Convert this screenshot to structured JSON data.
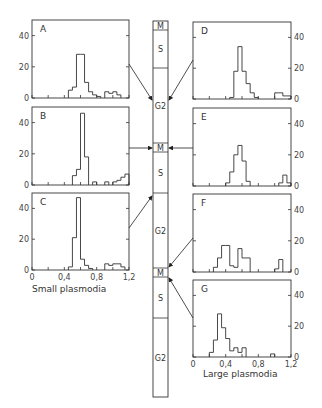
{
  "figure": {
    "left_caption": "Small plasmodia",
    "right_caption": "Large plasmodia"
  },
  "cell_cycle_column": {
    "segments": [
      {
        "label": "M",
        "y0": 21,
        "y1": 30
      },
      {
        "label": "S",
        "y0": 30,
        "y1": 68
      },
      {
        "label": "G2",
        "y0": 68,
        "y1": 143
      },
      {
        "label": "M",
        "y0": 143,
        "y1": 152
      },
      {
        "label": "S",
        "y0": 152,
        "y1": 193
      },
      {
        "label": "G2",
        "y0": 193,
        "y1": 268
      },
      {
        "label": "M",
        "y0": 268,
        "y1": 277
      },
      {
        "label": "S",
        "y0": 277,
        "y1": 318
      },
      {
        "label": "G2",
        "y0": 318,
        "y1": 397
      }
    ]
  },
  "chart_data": [
    {
      "type": "bar",
      "panel": "A",
      "group": "Small plasmodia",
      "side": "left",
      "box": [
        32,
        20,
        97,
        78
      ],
      "arrow_from": [
        129,
        64
      ],
      "arrow_to": [
        152,
        100
      ],
      "bin_width": 0.05,
      "xlim": [
        0,
        1.2
      ],
      "ylim": [
        0,
        50
      ],
      "xticks": [
        0,
        0.4,
        0.8,
        1.2
      ],
      "yticks": [
        0,
        20,
        40
      ],
      "bins": [
        [
          0.45,
          5
        ],
        [
          0.5,
          7
        ],
        [
          0.55,
          28
        ],
        [
          0.6,
          28
        ],
        [
          0.65,
          10
        ],
        [
          0.7,
          4
        ],
        [
          0.75,
          2
        ],
        [
          0.8,
          1
        ],
        [
          0.9,
          4
        ],
        [
          0.95,
          3
        ],
        [
          1.0,
          4
        ],
        [
          1.05,
          2
        ]
      ]
    },
    {
      "type": "bar",
      "panel": "B",
      "group": "Small plasmodia",
      "side": "left",
      "box": [
        32,
        107,
        97,
        78
      ],
      "arrow_from": [
        129,
        148
      ],
      "arrow_to": [
        152,
        148
      ],
      "bin_width": 0.05,
      "xlim": [
        0,
        1.2
      ],
      "ylim": [
        0,
        50
      ],
      "xticks": [
        0,
        0.4,
        0.8,
        1.2
      ],
      "yticks": [
        0,
        20,
        40
      ],
      "bins": [
        [
          0.5,
          6
        ],
        [
          0.55,
          10
        ],
        [
          0.6,
          46
        ],
        [
          0.65,
          18
        ],
        [
          0.75,
          2
        ],
        [
          0.9,
          2
        ],
        [
          1.0,
          2
        ],
        [
          1.05,
          3
        ],
        [
          1.1,
          5
        ],
        [
          1.15,
          7
        ]
      ]
    },
    {
      "type": "bar",
      "panel": "C",
      "group": "Small plasmodia",
      "side": "left",
      "box": [
        32,
        193,
        97,
        77
      ],
      "arrow_from": [
        129,
        228
      ],
      "arrow_to": [
        152,
        196
      ],
      "bin_width": 0.05,
      "xlim": [
        0,
        1.2
      ],
      "ylim": [
        0,
        50
      ],
      "xticks": [
        0,
        0.4,
        0.8,
        1.2
      ],
      "xticklabels": [
        "0",
        "0,4",
        "0,8",
        "1,2"
      ],
      "yticks": [
        0,
        20,
        40
      ],
      "bins": [
        [
          0.45,
          2
        ],
        [
          0.5,
          21
        ],
        [
          0.55,
          47
        ],
        [
          0.6,
          7
        ],
        [
          0.65,
          3
        ],
        [
          0.7,
          1
        ],
        [
          0.9,
          4
        ],
        [
          0.95,
          3
        ],
        [
          1.0,
          4
        ],
        [
          1.05,
          4
        ],
        [
          1.1,
          2
        ]
      ]
    },
    {
      "type": "bar",
      "panel": "D",
      "group": "Large plasmodia",
      "side": "right",
      "box": [
        193,
        22,
        98,
        77
      ],
      "arrow_from": [
        193,
        60
      ],
      "arrow_to": [
        169,
        100
      ],
      "bin_width": 0.05,
      "xlim": [
        0,
        1.2
      ],
      "ylim": [
        0,
        50
      ],
      "xticks": [
        0,
        0.4,
        0.8,
        1.2
      ],
      "yticks": [
        0,
        20,
        40
      ],
      "bins": [
        [
          0.45,
          1
        ],
        [
          0.5,
          18
        ],
        [
          0.55,
          34
        ],
        [
          0.6,
          18
        ],
        [
          0.65,
          10
        ],
        [
          0.7,
          4
        ],
        [
          0.75,
          1
        ],
        [
          1.0,
          4
        ],
        [
          1.05,
          4
        ],
        [
          1.1,
          2
        ],
        [
          1.15,
          2
        ]
      ]
    },
    {
      "type": "bar",
      "panel": "E",
      "group": "Large plasmodia",
      "side": "right",
      "box": [
        193,
        108,
        98,
        78
      ],
      "arrow_from": [
        193,
        148
      ],
      "arrow_to": [
        169,
        148
      ],
      "bin_width": 0.05,
      "xlim": [
        0,
        1.2
      ],
      "ylim": [
        0,
        50
      ],
      "xticks": [
        0,
        0.4,
        0.8,
        1.2
      ],
      "yticks": [
        0,
        20,
        40
      ],
      "bins": [
        [
          0.4,
          2
        ],
        [
          0.45,
          9
        ],
        [
          0.5,
          20
        ],
        [
          0.55,
          26
        ],
        [
          0.6,
          16
        ],
        [
          0.65,
          3
        ],
        [
          1.05,
          2
        ],
        [
          1.1,
          7
        ],
        [
          1.15,
          2
        ]
      ]
    },
    {
      "type": "bar",
      "panel": "F",
      "group": "Large plasmodia",
      "side": "right",
      "box": [
        193,
        194,
        98,
        78
      ],
      "arrow_from": [
        193,
        238
      ],
      "arrow_to": [
        169,
        267
      ],
      "bin_width": 0.05,
      "xlim": [
        0,
        1.2
      ],
      "ylim": [
        0,
        50
      ],
      "xticks": [
        0,
        0.4,
        0.8,
        1.2
      ],
      "yticks": [
        0,
        20,
        40
      ],
      "bins": [
        [
          0.25,
          3
        ],
        [
          0.3,
          9
        ],
        [
          0.35,
          17
        ],
        [
          0.4,
          17
        ],
        [
          0.45,
          4
        ],
        [
          0.5,
          3
        ],
        [
          0.55,
          15
        ],
        [
          0.6,
          9
        ],
        [
          0.65,
          9
        ],
        [
          1.0,
          2
        ],
        [
          1.05,
          8
        ]
      ]
    },
    {
      "type": "bar",
      "panel": "G",
      "group": "Large plasmodia",
      "side": "right",
      "box": [
        193,
        280,
        98,
        77
      ],
      "arrow_from": [
        193,
        318
      ],
      "arrow_to": [
        169,
        278
      ],
      "bin_width": 0.05,
      "xlim": [
        0,
        1.2
      ],
      "ylim": [
        0,
        50
      ],
      "xticks": [
        0,
        0.4,
        0.8,
        1.2
      ],
      "xticklabels": [
        "0",
        "0,4",
        "0,8",
        "1,2"
      ],
      "yticks": [
        0,
        20,
        40
      ],
      "bins": [
        [
          0.2,
          3
        ],
        [
          0.25,
          11
        ],
        [
          0.3,
          28
        ],
        [
          0.35,
          19
        ],
        [
          0.4,
          12
        ],
        [
          0.45,
          4
        ],
        [
          0.5,
          6
        ],
        [
          0.55,
          3
        ],
        [
          0.6,
          6
        ],
        [
          0.95,
          2
        ]
      ]
    }
  ]
}
